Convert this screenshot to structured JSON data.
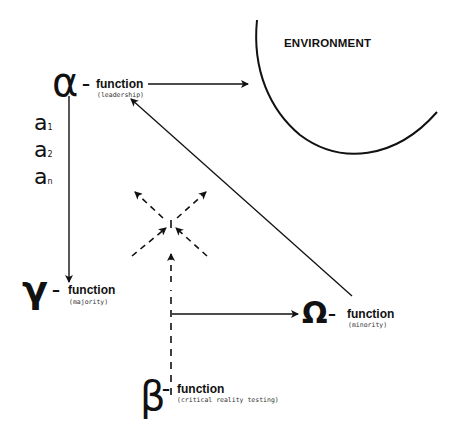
{
  "environment": {
    "label": "ENVIRONMENT"
  },
  "nodes": {
    "alpha": {
      "symbol": "α",
      "dash": "–",
      "label": "function",
      "sublabel": "(leadership)"
    },
    "gamma": {
      "symbol": "γ",
      "dash": "–",
      "label": "function",
      "sublabel": "(majority)"
    },
    "omega": {
      "symbol": "Ω",
      "dash": "–",
      "label": "function",
      "sublabel": "(minority)"
    },
    "beta": {
      "symbol": "β",
      "dash": "–",
      "label": "function",
      "sublabel": "(critical reality testing)"
    }
  },
  "alpha_members": [
    {
      "base": "a",
      "index": "1"
    },
    {
      "base": "a",
      "index": "2"
    },
    {
      "base": "a",
      "index": "n"
    }
  ],
  "edges": [
    {
      "from": "alpha",
      "to": "environment",
      "style": "solid"
    },
    {
      "from": "alpha",
      "to": "gamma",
      "style": "solid"
    },
    {
      "from": "omega",
      "to": "alpha",
      "style": "solid"
    },
    {
      "from": "beta",
      "to": "omega",
      "style": "solid"
    },
    {
      "from": "beta",
      "to": "center",
      "style": "dashed"
    },
    {
      "from": "center",
      "to": "diagonals",
      "style": "dashed",
      "count": 4
    }
  ]
}
